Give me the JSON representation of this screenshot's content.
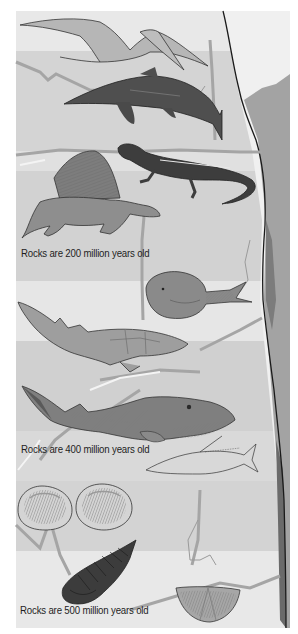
{
  "figure": {
    "palette": {
      "background": "#ffffff",
      "sky": "#e6e6e6",
      "band_light": "#dddddd",
      "band_mid": "#cfcfcf",
      "cliff": "#9a9a9a",
      "cliff_dark": "#6e6e6e",
      "crack": "#a8a8a8",
      "outline": "#1a1a1a",
      "text": "#1e1e1e"
    },
    "labels": [
      {
        "id": "age-200",
        "text": "Rocks are 200 million years old",
        "x": 21,
        "y": 254
      },
      {
        "id": "age-400",
        "text": "Rocks are 400 million years old",
        "x": 21,
        "y": 450
      },
      {
        "id": "age-500",
        "text": "Rocks are 500 million years old",
        "x": 20,
        "y": 611
      }
    ],
    "layers": [
      {
        "name": "200-million-year layer",
        "fossils": [
          "pterosaur",
          "ichthyosaur",
          "lizard-like reptile",
          "dimetrodon"
        ]
      },
      {
        "name": "400-million-year layer",
        "fossils": [
          "armored jawless fish",
          "placoderm fish",
          "large armored fish",
          "small bony fish"
        ]
      },
      {
        "name": "500-million-year layer",
        "fossils": [
          "brachiopod shell",
          "brachiopod shell",
          "trilobite",
          "trilobite head shield"
        ]
      }
    ]
  }
}
